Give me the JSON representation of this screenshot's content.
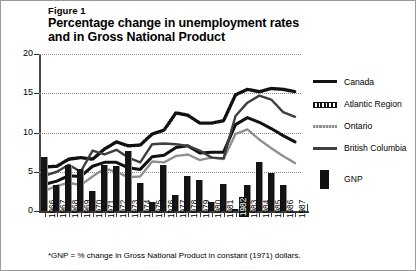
{
  "figure": {
    "label": "Figure 1",
    "title": "Percentage change in unemployment rates and in Gross National Product",
    "title_line1": "Percentage change in unemployment rates",
    "title_line2": "and in Gross National Product",
    "footnote": "*GNP = % change in Gross National Product in constant (1971) dollars."
  },
  "legend": {
    "position": "right",
    "items": [
      {
        "label": "Canada",
        "style": "solid-thick",
        "color": "#111111",
        "mark": "canada-line-swatch"
      },
      {
        "label": "Atlantic Region",
        "style": "dotted-bead",
        "color": "#111111",
        "mark": "atlantic-line-swatch"
      },
      {
        "label": "Ontario",
        "style": "dotted-thin-gray",
        "color": "#8f8f8f",
        "mark": "ontario-line-swatch"
      },
      {
        "label": "British Columbia",
        "style": "solid-medium",
        "color": "#3f3f3f",
        "mark": "british-columbia-line-swatch"
      },
      {
        "label": "GNP",
        "style": "bar",
        "color": "#111111",
        "mark": "gnp-bar-swatch"
      }
    ]
  },
  "axes": {
    "y_ticks": [
      0,
      5,
      10,
      15,
      20
    ],
    "y_tick_labels": [
      "0",
      "5",
      "10",
      "15",
      "20"
    ],
    "ylim": [
      0,
      20
    ],
    "xlim_labels": [
      "1966",
      "1987"
    ],
    "highlight_year": "1982",
    "grid": "horizontal-dotted"
  },
  "chart_data": {
    "type": "line",
    "title": "Percentage change in unemployment rates and in Gross National Product",
    "xlabel": "",
    "ylabel": "",
    "ylim": [
      0,
      20
    ],
    "grid": true,
    "legend_position": "right",
    "categories": [
      "1966",
      "1967",
      "1968",
      "1969",
      "1970",
      "1971",
      "1972",
      "1973",
      "1974",
      "1975",
      "1976",
      "1977",
      "1978",
      "1979",
      "1980",
      "1981",
      "1982",
      "1983",
      "1984",
      "1985",
      "1986",
      "1987"
    ],
    "series": [
      {
        "name": "Canada",
        "type": "line",
        "style": "solid-thick",
        "color": "#111111",
        "values": [
          3.4,
          3.8,
          4.5,
          4.4,
          5.7,
          6.2,
          6.2,
          5.5,
          5.3,
          6.9,
          7.1,
          8.1,
          8.3,
          7.4,
          7.5,
          7.5,
          11.0,
          11.9,
          11.3,
          10.5,
          9.6,
          8.8
        ]
      },
      {
        "name": "Atlantic Region",
        "type": "line",
        "style": "dotted-bead",
        "color": "#111111",
        "values": [
          5.6,
          5.7,
          6.6,
          6.8,
          6.6,
          7.9,
          8.8,
          8.3,
          8.4,
          9.8,
          10.3,
          12.5,
          12.2,
          11.2,
          11.2,
          11.5,
          14.8,
          15.5,
          15.2,
          15.6,
          15.5,
          15.2
        ]
      },
      {
        "name": "Ontario",
        "type": "line",
        "style": "dotted-thin-gray",
        "color": "#8f8f8f",
        "values": [
          2.6,
          3.2,
          3.6,
          3.3,
          4.4,
          5.4,
          5.0,
          4.3,
          4.4,
          6.3,
          6.2,
          7.0,
          7.2,
          6.5,
          6.8,
          6.6,
          9.8,
          10.4,
          9.1,
          8.0,
          7.0,
          6.1
        ]
      },
      {
        "name": "British Columbia",
        "type": "line",
        "style": "solid-medium",
        "color": "#3f3f3f",
        "values": [
          4.5,
          5.0,
          5.9,
          5.0,
          7.7,
          7.2,
          7.8,
          6.8,
          6.2,
          8.5,
          8.6,
          8.5,
          8.3,
          7.7,
          6.8,
          6.7,
          12.1,
          13.8,
          14.7,
          14.2,
          12.6,
          12.0
        ]
      }
    ],
    "bars": {
      "name": "GNP",
      "type": "bar",
      "color": "#111111",
      "note": "*GNP = % change in Gross National Product in constant (1971) dollars.",
      "values": [
        6.9,
        3.3,
        5.8,
        5.3,
        2.5,
        5.8,
        5.7,
        7.6,
        3.6,
        1.2,
        5.9,
        2.1,
        4.5,
        3.9,
        1.1,
        3.4,
        0.2,
        3.3,
        6.3,
        4.8,
        3.3,
        0.0
      ]
    }
  }
}
